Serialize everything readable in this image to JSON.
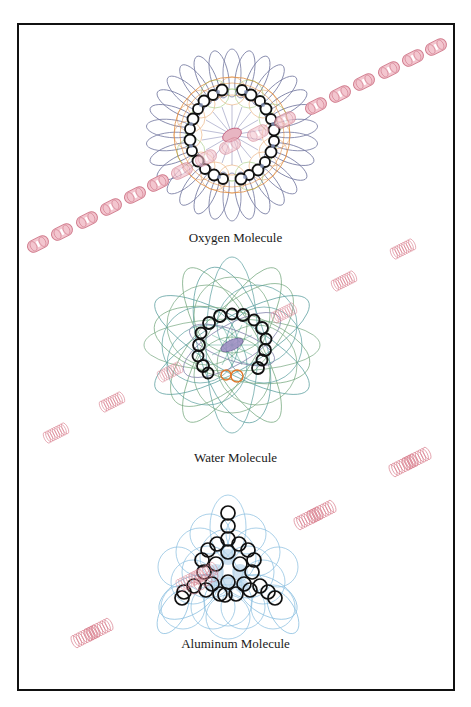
{
  "figure": {
    "panels": [
      {
        "id": "oxygen",
        "label": "Oxygen Molecule",
        "center": [
          232,
          135
        ],
        "colors": {
          "petals": "#6a6f9a",
          "ring_orange": "#e08a3c",
          "ring_green": "#7bb54a",
          "beads": "#111111",
          "core": "#c05a7a"
        }
      },
      {
        "id": "water",
        "label": "Water Molecule",
        "center": [
          232,
          345
        ],
        "colors": {
          "loops_green": "#5f9a6a",
          "loops_teal": "#3f8f8f",
          "beads": "#111111",
          "hydrogen": "#e0762a",
          "core": "#7a6aa8"
        }
      },
      {
        "id": "aluminum",
        "label": "Aluminum Molecule",
        "center": [
          228,
          572
        ],
        "colors": {
          "loops_blue": "#6aaed8",
          "beads": "#111111",
          "fill": "#9cc4e0"
        }
      }
    ],
    "overlay": {
      "description": "pink coil chains running diagonally across the page",
      "color": "#d9808f"
    },
    "caption": ""
  }
}
